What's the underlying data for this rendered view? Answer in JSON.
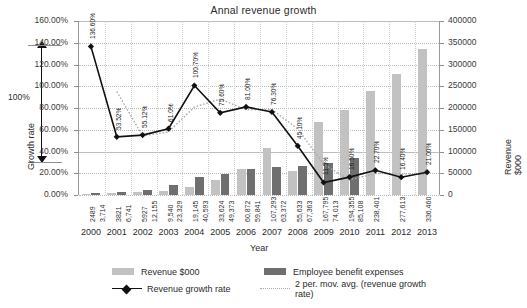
{
  "chart_data": {
    "type": "bar",
    "title": "Annal revenue growth",
    "xlabel": "Year",
    "ylabel": "Growth rate",
    "y2label": "Revenue $000",
    "categories": [
      "2000",
      "2001",
      "2002",
      "2003",
      "2004",
      "2005",
      "2006",
      "2007",
      "2008",
      "2009",
      "2010",
      "2011",
      "2012",
      "2013"
    ],
    "ylim": [
      0,
      160
    ],
    "yticks": [
      "0.00%",
      "20.00%",
      "40.00%",
      "60.00%",
      "80.00%",
      "100.00%",
      "120.00%",
      "140.00%",
      "160.00%"
    ],
    "y2lim": [
      0,
      400000
    ],
    "y2ticks": [
      "0",
      "50000",
      "100000",
      "150000",
      "200000",
      "250000",
      "300000",
      "350000",
      "400000"
    ],
    "grid": true,
    "legend_position": "bottom",
    "series": [
      {
        "name": "Revenue $000",
        "type": "bar",
        "axis": "y2",
        "color": "#c2c2c2",
        "values": [
          2489,
          3821,
          5927,
          9540,
          19145,
          33624,
          60872,
          107293,
          55633,
          167795,
          194355,
          238401,
          277613,
          336460
        ],
        "labels": [
          "2489",
          "3821",
          "5927",
          "9,540",
          "19,145",
          "33,624",
          "60,872",
          "107,293",
          "55,633",
          "167,795",
          "194,355",
          "238,401",
          "277,613",
          "336,460"
        ]
      },
      {
        "name": "Employee benefit expenses",
        "type": "bar",
        "axis": "y2",
        "color": "#6f6f6f",
        "values": [
          3714,
          6741,
          12155,
          23329,
          40593,
          49373,
          59841,
          63372,
          67363,
          74013,
          85108,
          null,
          null,
          null
        ],
        "labels": [
          "3,714",
          "6,741",
          "12,155",
          "23,329",
          "40,593",
          "49,373",
          "59,841",
          "63,372",
          "67,363",
          "74,013",
          "85,108",
          "",
          "",
          ""
        ]
      },
      {
        "name": "Revenue growth rate",
        "type": "line",
        "axis": "y",
        "color": "#111111",
        "values": [
          136.6,
          53.52,
          55.12,
          61.0,
          100.7,
          75.6,
          81.0,
          76.3,
          45.1,
          11.5,
          16.5,
          22.7,
          16.4,
          21.0
        ],
        "labels": [
          "136.60%",
          "53.52%",
          "55.12%",
          "61.0%",
          "100.70%",
          "75.60%",
          "81.00%",
          "76.30%",
          "45.10%",
          "11.5%",
          "16.50%",
          "22.70%",
          "16.40%",
          "21.00%"
        ]
      },
      {
        "name": "2 per. mov. avg. (revenue growth rate)",
        "type": "line",
        "axis": "y",
        "color": "#a8a8a8",
        "style": "dotted",
        "values": [
          null,
          95.06,
          54.32,
          58.06,
          80.85,
          88.15,
          78.3,
          78.65,
          60.7,
          28.3,
          14.0,
          19.6,
          19.55,
          18.7
        ]
      }
    ],
    "annotation": {
      "label": "100%",
      "from": 40,
      "to": 140
    }
  },
  "legend": {
    "items": [
      {
        "label": "Revenue $000",
        "marker": "swatch-light"
      },
      {
        "label": "Employee benefit expenses",
        "marker": "swatch-dark"
      },
      {
        "label": "Revenue growth rate",
        "marker": "line-diamond"
      },
      {
        "label": "2 per. mov. avg. (revenue growth rate)",
        "marker": "line-dotted"
      }
    ]
  }
}
